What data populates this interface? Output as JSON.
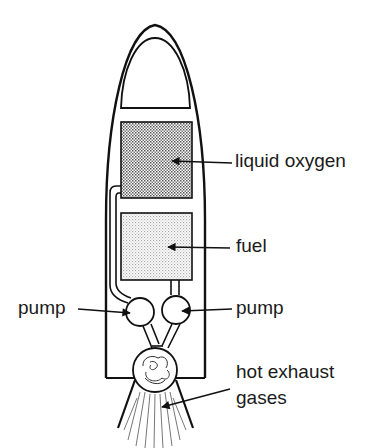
{
  "diagram": {
    "colors": {
      "stroke": "#111111",
      "lox_fill": "#bdbdbd",
      "fuel_fill": "#dedede",
      "background": "#ffffff"
    },
    "labels": {
      "liquid_oxygen": "liquid oxygen",
      "fuel": "fuel",
      "pump_left": "pump",
      "pump_right": "pump",
      "exhaust_line1": "hot exhaust",
      "exhaust_line2": "gases"
    },
    "components": [
      {
        "id": "nose-cone",
        "label": ""
      },
      {
        "id": "lox-tank",
        "label": "liquid oxygen"
      },
      {
        "id": "fuel-tank",
        "label": "fuel"
      },
      {
        "id": "pump-left",
        "label": "pump"
      },
      {
        "id": "pump-right",
        "label": "pump"
      },
      {
        "id": "combustion-chamber",
        "label": ""
      },
      {
        "id": "exhaust-plume",
        "label": "hot exhaust gases"
      }
    ]
  }
}
